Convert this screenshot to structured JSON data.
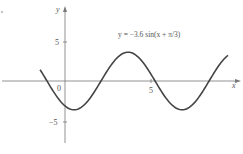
{
  "chart_data": {
    "type": "line",
    "title": "y = −3.6 sin(x + π/3)",
    "xlabel": "x",
    "ylabel": "y",
    "origin_label": "0",
    "x_ticks": [
      {
        "value": 5,
        "label": "5"
      }
    ],
    "y_ticks": [
      {
        "value": 5,
        "label": "5"
      },
      {
        "value": -5,
        "label": "−5"
      }
    ],
    "xlim": [
      -3.8,
      10.2
    ],
    "ylim": [
      -8,
      10
    ],
    "grid": false,
    "legend": "none",
    "series": [
      {
        "name": "y = −3.6 sin(x + π/3)",
        "function": {
          "amplitude": -3.6,
          "phase": 1.0472
        },
        "x_range": [
          -1.45,
          9.48
        ],
        "sample_points": [
          {
            "x": -1.45,
            "y": 1.41
          },
          {
            "x": -1.047,
            "y": 0
          },
          {
            "x": 0,
            "y": -3.12
          },
          {
            "x": 0.524,
            "y": -3.6
          },
          {
            "x": 2.094,
            "y": 0
          },
          {
            "x": 3.665,
            "y": 3.6
          },
          {
            "x": 5.236,
            "y": 0
          },
          {
            "x": 6.807,
            "y": -3.6
          },
          {
            "x": 8.378,
            "y": 0
          },
          {
            "x": 9.48,
            "y": 3.21
          }
        ]
      }
    ]
  }
}
